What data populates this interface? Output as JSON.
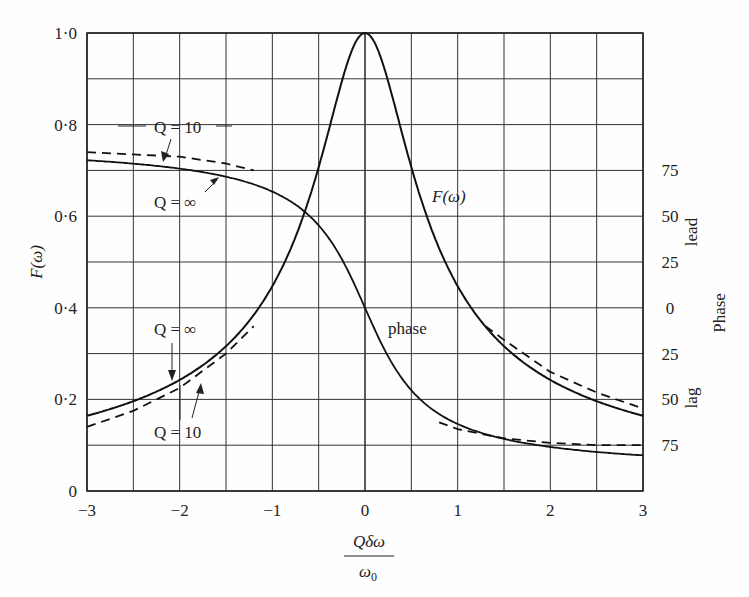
{
  "chart_data": {
    "type": "line",
    "title": "",
    "xlabel": "Qδω/ω0",
    "xlabel_num": "Qδω",
    "xlabel_den": "ω0",
    "ylabel": "F(ω)",
    "y2label": "Phase",
    "y2_lead_label": "lead",
    "y2_lag_label": "lag",
    "xlim": [
      -3,
      3
    ],
    "ylim": [
      0,
      1.0
    ],
    "grid": true,
    "x_ticks": [
      -3,
      -2,
      -1,
      0,
      1,
      2,
      3
    ],
    "x_tick_labels": [
      "−3",
      "−2",
      "−1",
      "0",
      "1",
      "2",
      "3"
    ],
    "y_ticks": [
      0,
      0.2,
      0.4,
      0.6,
      0.8,
      1.0
    ],
    "y_tick_labels": [
      "0",
      "0·2",
      "0·4",
      "0·6",
      "0·8",
      "1·0"
    ],
    "y2_ticks_at_y": [
      0.7,
      0.6,
      0.5,
      0.4,
      0.3,
      0.2,
      0.1
    ],
    "y2_tick_labels": [
      "75",
      "50",
      "25",
      "0",
      "25",
      "50",
      "75"
    ],
    "series": [
      {
        "name": "F(ω), Q = ∞",
        "style": "solid",
        "x": [
          -3,
          -2.5,
          -2,
          -1.5,
          -1,
          -0.5,
          0,
          0.5,
          1,
          1.5,
          2,
          2.5,
          3
        ],
        "values": [
          0.164,
          0.196,
          0.243,
          0.316,
          0.447,
          0.707,
          1.0,
          0.707,
          0.447,
          0.316,
          0.243,
          0.196,
          0.164
        ]
      },
      {
        "name": "F(ω), Q = 10",
        "style": "dashed",
        "x": [
          -3,
          -2.5,
          -2,
          -1.5,
          -1.2
        ],
        "values": [
          0.14,
          0.175,
          0.225,
          0.3,
          0.36
        ]
      },
      {
        "name": "F(ω), Q = 10 (high side)",
        "style": "dashed",
        "x": [
          1.3,
          1.5,
          2,
          2.5,
          3
        ],
        "values": [
          0.36,
          0.33,
          0.26,
          0.215,
          0.18
        ]
      },
      {
        "name": "phase, Q = ∞",
        "style": "solid",
        "x": [
          -3,
          -2,
          -1,
          -0.5,
          0,
          0.5,
          1,
          2,
          3
        ],
        "phase_deg": [
          80.5,
          76,
          63.4,
          45,
          0,
          -45,
          -63.4,
          -76,
          -80.5
        ]
      },
      {
        "name": "phase, Q = 10",
        "style": "dashed",
        "x_low": [
          -3,
          -2.5,
          -2,
          -1.5,
          -1.2
        ],
        "values_low": [
          0.74,
          0.735,
          0.73,
          0.715,
          0.7
        ],
        "x_high": [
          0.8,
          1,
          1.5,
          2,
          2.5,
          3
        ],
        "values_high": [
          0.15,
          0.135,
          0.115,
          0.105,
          0.1,
          0.1
        ]
      }
    ],
    "annotations": [
      "Q = 10",
      "Q = ∞",
      "Q = ∞",
      "Q = 10",
      "F(ω)",
      "phase"
    ]
  },
  "labels": {
    "ann_q10_top": "Q = 10",
    "ann_qinf_top": "Q = ∞",
    "ann_qinf_bottom": "Q = ∞",
    "ann_q10_bottom": "Q = 10",
    "curve_f": "F(ω)",
    "curve_phase": "phase"
  }
}
